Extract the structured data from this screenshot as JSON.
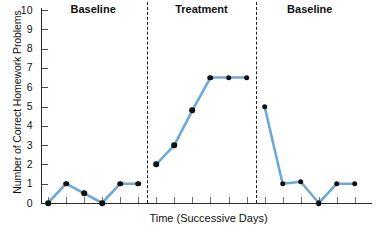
{
  "chart_data": {
    "type": "line",
    "title": "",
    "xlabel": "Time (Successive Days)",
    "ylabel": "Number of Correct Homework Problems",
    "ylim": [
      0,
      10
    ],
    "yticks": [
      0,
      1,
      2,
      3,
      4,
      5,
      6,
      7,
      8,
      9,
      10
    ],
    "ytick_labels": [
      "0",
      "1",
      "2",
      "3",
      "4",
      "5",
      "6",
      "7",
      "8",
      "9",
      "10"
    ],
    "xtick_labels": [],
    "grid": false,
    "legend": null,
    "line_color": "#6FA8D6",
    "marker_color": "#111111",
    "phases": [
      {
        "label": "Baseline",
        "x": [
          1,
          2,
          3,
          4,
          5,
          6
        ],
        "values": [
          0,
          1,
          0.5,
          0,
          1,
          1
        ]
      },
      {
        "label": "Treatment",
        "x": [
          7,
          8,
          9,
          10,
          11,
          12
        ],
        "values": [
          2,
          3,
          4.8,
          6.5,
          6.5,
          6.5
        ]
      },
      {
        "label": "Baseline",
        "x": [
          13,
          14,
          15,
          16,
          17,
          18
        ],
        "values": [
          5,
          1,
          1.1,
          0,
          1,
          1
        ]
      }
    ],
    "x": [
      1,
      2,
      3,
      4,
      5,
      6,
      7,
      8,
      9,
      10,
      11,
      12,
      13,
      14,
      15,
      16,
      17,
      18
    ],
    "values": [
      0,
      1,
      0.5,
      0,
      1,
      1,
      2,
      3,
      4.8,
      6.5,
      6.5,
      6.5,
      5,
      1,
      1.1,
      0,
      1,
      1
    ],
    "phase_dividers_after_x": [
      6,
      12
    ],
    "annotations": []
  }
}
